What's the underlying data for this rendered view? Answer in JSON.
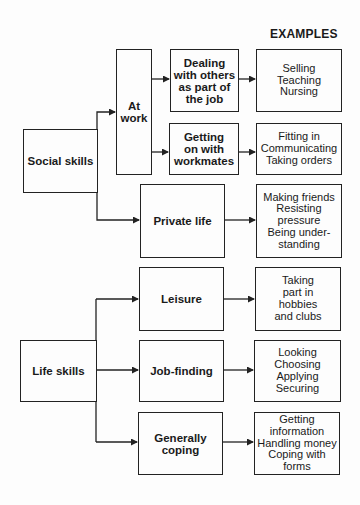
{
  "heading": "EXAMPLES",
  "roots": {
    "social": "Social skills",
    "life": "Life skills"
  },
  "categories": {
    "at_work": [
      "At",
      "work"
    ],
    "dealing": [
      "Dealing",
      "with others",
      "as part of",
      "the job"
    ],
    "getting_on": [
      "Getting",
      "on with",
      "workmates"
    ],
    "private_life": [
      "Private life"
    ],
    "leisure": [
      "Leisure"
    ],
    "job_finding": [
      "Job-finding"
    ],
    "coping": [
      "Generally",
      "coping"
    ]
  },
  "examples": {
    "dealing": [
      "Selling",
      "Teaching",
      "Nursing"
    ],
    "getting_on": [
      "Fitting in",
      "Communicating",
      "Taking orders"
    ],
    "private_life": [
      "Making friends",
      "Resisting",
      "pressure",
      "Being under-",
      "standing"
    ],
    "leisure": [
      "Taking",
      "part in",
      "hobbies",
      "and clubs"
    ],
    "job_finding": [
      "Looking",
      "Choosing",
      "Applying",
      "Securing"
    ],
    "coping": [
      "Getting",
      "information",
      "Handling money",
      "Coping with",
      "forms"
    ]
  },
  "colors": {
    "line": "#222222",
    "background": "#fdfdfd"
  }
}
